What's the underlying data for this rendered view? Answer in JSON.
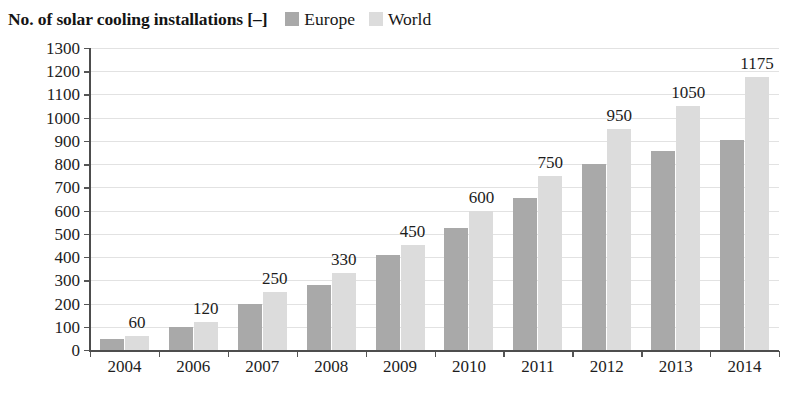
{
  "chart_data": {
    "type": "bar",
    "title": "No. of solar cooling installations [–]",
    "xlabel": "",
    "ylabel": "",
    "ylim": [
      0,
      1300
    ],
    "ytick_step": 100,
    "yticks": [
      "1300",
      "1200",
      "1100",
      "1000",
      "900",
      "800",
      "700",
      "600",
      "500",
      "400",
      "300",
      "200",
      "100",
      "0"
    ],
    "grid": true,
    "legend_position": "top-right",
    "categories": [
      "2004",
      "2006",
      "2007",
      "2008",
      "2009",
      "2010",
      "2011",
      "2012",
      "2013",
      "2014"
    ],
    "series": [
      {
        "name": "Europe",
        "color": "#a9a9a9",
        "values": [
          48,
          100,
          200,
          280,
          410,
          525,
          655,
          800,
          855,
          905
        ]
      },
      {
        "name": "World",
        "color": "#dcdcdc",
        "values": [
          60,
          120,
          250,
          330,
          450,
          600,
          750,
          950,
          1050,
          1175
        ]
      }
    ],
    "data_labels": [
      "60",
      "120",
      "250",
      "330",
      "450",
      "600",
      "750",
      "950",
      "1050",
      "1175"
    ],
    "data_labels_series": "World"
  },
  "legend": {
    "items": [
      {
        "label": "Europe",
        "color": "#a9a9a9"
      },
      {
        "label": "World",
        "color": "#dcdcdc"
      }
    ]
  }
}
